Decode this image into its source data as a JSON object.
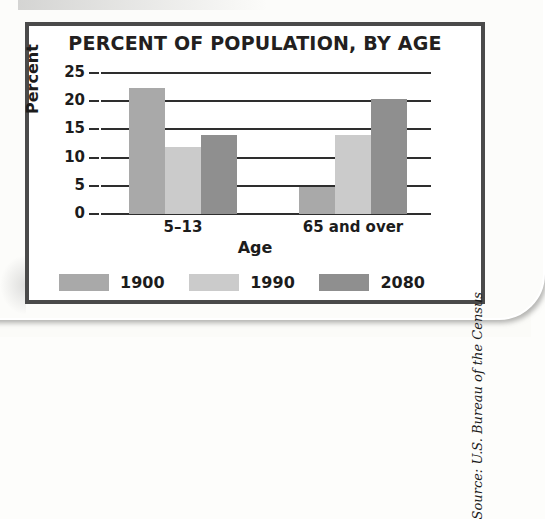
{
  "figure": {
    "title": "PERCENT OF POPULATION, BY AGE",
    "source": "Source: U.S. Bureau of the Census",
    "frame_color": "#4a4a4a",
    "background": "#ffffff"
  },
  "chart_data": {
    "type": "bar",
    "title": "PERCENT OF POPULATION, BY AGE",
    "xlabel": "Age",
    "ylabel": "Percent",
    "categories": [
      "5–13",
      "65 and over"
    ],
    "series": [
      {
        "name": "1900",
        "color": "#a9a9a9",
        "values": [
          22.3,
          4.8
        ]
      },
      {
        "name": "1990",
        "color": "#cbcbcb",
        "values": [
          11.8,
          14.0
        ]
      },
      {
        "name": "2080",
        "color": "#8f8f8f",
        "values": [
          14.0,
          20.4
        ]
      }
    ],
    "ylim": [
      0,
      25
    ],
    "yticks": [
      0,
      5,
      10,
      15,
      20,
      25
    ],
    "ytick_labels": [
      "0",
      "5",
      "10",
      "15",
      "20",
      "25"
    ],
    "grid": true,
    "grid_color": "#2e2e2e",
    "legend_position": "bottom"
  }
}
